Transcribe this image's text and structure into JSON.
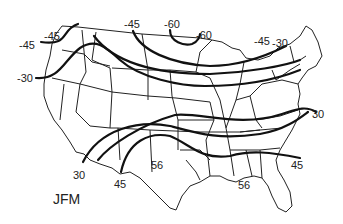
{
  "figure": {
    "season_label": "JFM",
    "contour_labels": [
      {
        "text": "-45",
        "x": 124,
        "y": 19
      },
      {
        "text": "-60",
        "x": 164,
        "y": 19
      },
      {
        "text": "-60",
        "x": 196,
        "y": 30
      },
      {
        "text": "-45",
        "x": 254,
        "y": 36
      },
      {
        "text": "-30",
        "x": 272,
        "y": 38
      },
      {
        "text": "-45",
        "x": 19,
        "y": 40
      },
      {
        "text": "-45",
        "x": 44,
        "y": 31
      },
      {
        "text": "-30",
        "x": 17,
        "y": 73
      },
      {
        "text": "30",
        "x": 312,
        "y": 109
      },
      {
        "text": "45",
        "x": 291,
        "y": 160
      },
      {
        "text": "56",
        "x": 151,
        "y": 160
      },
      {
        "text": "56",
        "x": 238,
        "y": 180
      },
      {
        "text": "30",
        "x": 73,
        "y": 170
      },
      {
        "text": "45",
        "x": 114,
        "y": 179
      }
    ]
  }
}
